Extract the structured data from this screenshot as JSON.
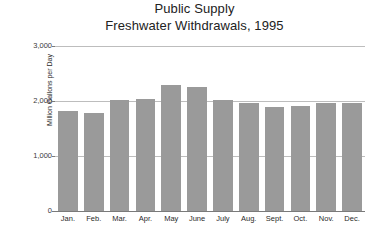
{
  "chart_data": {
    "type": "bar",
    "title": "Public Supply Freshwater Withdrawals, 1995",
    "title_lines": [
      "Public Supply",
      "Freshwater Withdrawals, 1995"
    ],
    "xlabel": "",
    "ylabel": "Million Gallons per Day",
    "categories": [
      "Jan.",
      "Feb.",
      "Mar.",
      "Apr.",
      "May",
      "June",
      "July",
      "Aug.",
      "Sept.",
      "Oct.",
      "Nov.",
      "Dec."
    ],
    "values": [
      1820,
      1790,
      2010,
      2030,
      2300,
      2260,
      2020,
      1960,
      1900,
      1910,
      1960,
      1960
    ],
    "ylim": [
      0,
      3000
    ],
    "ytick_values": [
      0,
      1000,
      2000,
      3000
    ],
    "ytick_labels": [
      "0",
      "1,000",
      "2,000",
      "3,000"
    ],
    "grid": true,
    "legend": false,
    "bar_color": "#9a9a9a",
    "gridline_color": "#bdbdbd",
    "axis_color": "#7a7a7a"
  }
}
